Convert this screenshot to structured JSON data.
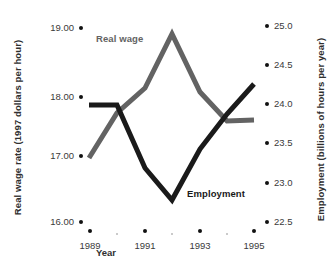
{
  "chart_data": {
    "type": "line",
    "title": "",
    "xlabel": "Year",
    "x": [
      1989,
      1990,
      1991,
      1992,
      1993,
      1994,
      1995
    ],
    "xticklabels": [
      "1989",
      "1991",
      "1993",
      "1995"
    ],
    "xtick_major_years": [
      1989,
      1991,
      1993,
      1995
    ],
    "xtick_minor_years": [
      1990,
      1992,
      1994
    ],
    "grid": false,
    "legend": "inline-annotations",
    "series": [
      {
        "name": "Real wage",
        "axis": "left",
        "color": "#636363",
        "ylabel": "Real wage rate (1997 dollars per hour)",
        "yticklabels": [
          "16.00",
          "17.00",
          "18.00",
          "19.00"
        ],
        "ytickvalues": [
          16.0,
          17.0,
          18.0,
          19.0
        ],
        "ylim": [
          15.7,
          19.15
        ],
        "values": [
          17.0,
          17.85,
          18.35,
          19.0,
          18.45,
          18.08,
          18.1
        ]
      },
      {
        "name": "Employment",
        "axis": "right",
        "color": "#1a1a1a",
        "ylabel": "Employment (billions of hours per year)",
        "yticklabels": [
          "22.5",
          "23.0",
          "23.5",
          "24.0",
          "24.5",
          "25.0"
        ],
        "ytickvalues": [
          22.5,
          23.0,
          23.5,
          24.0,
          24.5,
          25.0
        ],
        "ylim": [
          22.42,
          25.02
        ],
        "values": [
          24.0,
          24.0,
          23.05,
          22.72,
          23.4,
          23.92,
          24.4
        ]
      }
    ],
    "annotations": [
      {
        "text": "Real wage",
        "color": "#636363"
      },
      {
        "text": "Employment",
        "color": "#1a1a1a"
      }
    ]
  },
  "axes": {
    "left": {
      "title": "Real wage rate (1997 dollars per hour)",
      "ticks": [
        {
          "label": "19.00",
          "y": 28
        },
        {
          "label": "18.00",
          "y": 97
        },
        {
          "label": "17.00",
          "y": 156
        },
        {
          "label": "16.00",
          "y": 222
        }
      ]
    },
    "right": {
      "title": "Employment (billions of hours per year)",
      "ticks": [
        {
          "label": "25.0",
          "y": 26
        },
        {
          "label": "24.5",
          "y": 65
        },
        {
          "label": "24.0",
          "y": 104
        },
        {
          "label": "23.5",
          "y": 143
        },
        {
          "label": "23.0",
          "y": 183
        },
        {
          "label": "22.5",
          "y": 222
        }
      ]
    },
    "bottom": {
      "title": "Year",
      "ticks": [
        {
          "label": "1989",
          "x": 90,
          "major": true
        },
        {
          "label": "",
          "x": 117,
          "major": false
        },
        {
          "label": "1991",
          "x": 145,
          "major": true
        },
        {
          "label": "",
          "x": 172,
          "major": false
        },
        {
          "label": "1993",
          "x": 200,
          "major": true
        },
        {
          "label": "",
          "x": 227,
          "major": false
        },
        {
          "label": "1995",
          "x": 254,
          "major": true
        }
      ]
    }
  },
  "paths": {
    "real_wage": "M 89,158 L 117,113 L 145,88 L 172,34 L 200,92 L 227,121 L 254,120",
    "employment": "M 89,105 L 117,105 L 145,168 L 172,200 L 200,149 L 227,114 L 254,84"
  },
  "labels": {
    "real_wage": "Real wage",
    "employment": "Employment"
  }
}
